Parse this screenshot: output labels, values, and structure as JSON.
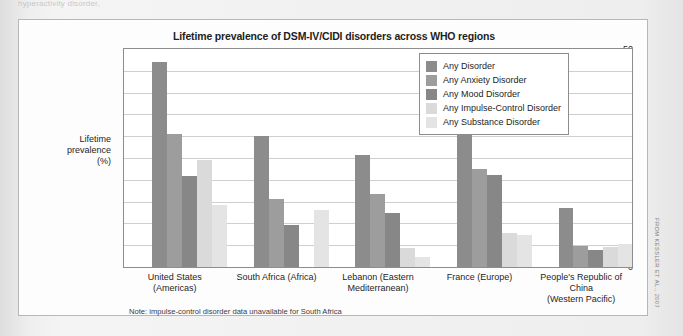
{
  "page": {
    "top_text_fragment": "hyperactivity disorder,"
  },
  "figure": {
    "title": "Lifetime prevalence of DSM-IV/CIDI disorders across WHO regions",
    "note": "Note: impulse-control disorder data unavailable for South Africa",
    "credit": "FROM KESSLER ET AL., 2007"
  },
  "chart_data": {
    "type": "bar",
    "title": "Lifetime prevalence of DSM-IV/CIDI disorders across WHO regions",
    "xlabel": "",
    "ylabel": "Lifetime prevalence (%)",
    "ylabel_lines": [
      "Lifetime",
      "prevalence",
      "(%)"
    ],
    "ylim": [
      0,
      50
    ],
    "yticks": [
      0,
      5,
      10,
      15,
      20,
      25,
      30,
      35,
      40,
      45,
      50
    ],
    "grid": true,
    "legend_position": "top-right",
    "categories": [
      "United States (Americas)",
      "South Africa (Africa)",
      "Lebanon (Eastern\nMediterranean)",
      "France (Europe)",
      "People's Republic of China\n(Western Pacific)"
    ],
    "category_lines": [
      [
        "United States (Americas)"
      ],
      [
        "South Africa (Africa)"
      ],
      [
        "Lebanon (Eastern",
        "Mediterranean)"
      ],
      [
        "France (Europe)"
      ],
      [
        "People's Republic of China",
        "(Western Pacific)"
      ]
    ],
    "series": [
      {
        "name": "Any Disorder",
        "color": "#8c8c8c",
        "values": [
          47.4,
          30.5,
          26.2,
          38.5,
          13.9
        ]
      },
      {
        "name": "Any Anxiety Disorder",
        "color": "#9d9d9d",
        "values": [
          31.0,
          16.0,
          17.1,
          22.9,
          5.4
        ]
      },
      {
        "name": "Any Mood Disorder",
        "color": "#878787",
        "values": [
          21.4,
          10.1,
          12.9,
          21.5,
          4.4
        ]
      },
      {
        "name": "Any Impulse-Control Disorder",
        "color": "#dadada",
        "values": [
          25.1,
          null,
          4.9,
          8.3,
          5.1
        ]
      },
      {
        "name": "Any Substance Disorder",
        "color": "#e4e4e4",
        "values": [
          14.6,
          13.6,
          2.8,
          7.8,
          5.8
        ]
      }
    ]
  }
}
